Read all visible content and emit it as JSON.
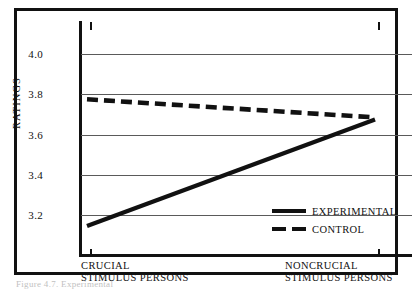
{
  "figure": {
    "caption": "Figure 4.7.  Experimental"
  },
  "chart_data": {
    "type": "line",
    "title": "",
    "xlabel": "",
    "ylabel": "RATINGS",
    "categories": [
      "CRUCIAL STIMULUS PERSONS",
      "NONCRUCIAL STIMULUS PERSONS"
    ],
    "category_lines": [
      [
        "CRUCIAL",
        "STIMULUS PERSONS"
      ],
      [
        "NONCRUCIAL",
        "STIMULUS PERSONS"
      ]
    ],
    "ylim": [
      3.05,
      4.1
    ],
    "yticks": [
      4.0,
      3.8,
      3.6,
      3.4,
      3.2
    ],
    "ytick_labels": [
      "4.0",
      "3.8",
      "3.6",
      "3.4",
      "3.2"
    ],
    "grid": true,
    "legend_position": "inside-lower-right",
    "series": [
      {
        "name": "EXPERIMENTAL",
        "style": "solid",
        "color": "#111111",
        "values": [
          3.13,
          3.66
        ]
      },
      {
        "name": "CONTROL",
        "style": "dashed",
        "color": "#111111",
        "values": [
          3.76,
          3.67
        ]
      }
    ]
  },
  "axis": {
    "y_title": "RATINGS",
    "y_labels": [
      "4.0",
      "3.8",
      "3.6",
      "3.4",
      "3.2"
    ]
  },
  "legend": {
    "items": [
      {
        "label": "EXPERIMENTAL",
        "style": "solid"
      },
      {
        "label": "CONTROL",
        "style": "dashed"
      }
    ]
  }
}
